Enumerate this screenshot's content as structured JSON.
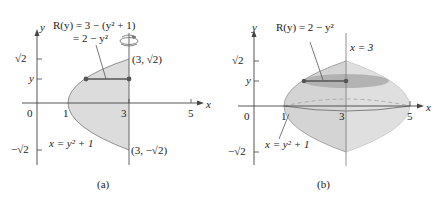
{
  "figure": {
    "panels": [
      {
        "id": "a",
        "caption": "(a)",
        "axis_x_label": "x",
        "axis_y_label": "y",
        "x_ticks": [
          "0",
          "1",
          "3",
          "5"
        ],
        "y_ticks": [
          "√2",
          "y",
          "−√2"
        ],
        "annotation_radius_line1": "R(y) = 3 − (y² + 1)",
        "annotation_radius_line2": "= 2 − y²",
        "point_top": "(3, √2)",
        "point_bottom": "(3, −√2)",
        "curve_label": "x = y² + 1",
        "rotation_icon": "rotation-arrow-icon"
      },
      {
        "id": "b",
        "caption": "(b)",
        "axis_x_label": "x",
        "axis_y_label": "y",
        "x_ticks": [
          "0",
          "1",
          "3",
          "5"
        ],
        "y_ticks": [
          "√2",
          "y",
          "−√2"
        ],
        "annotation_radius": "R(y) = 2 − y²",
        "axis_of_rotation_label": "x = 3",
        "curve_label": "x = y² + 1"
      }
    ],
    "colors": {
      "region_fill": "#dcdcdc",
      "solid_fill": "#d2d2d2",
      "disk_fill": "#a9a9a9",
      "line": "#555555",
      "point": "#555555"
    }
  }
}
